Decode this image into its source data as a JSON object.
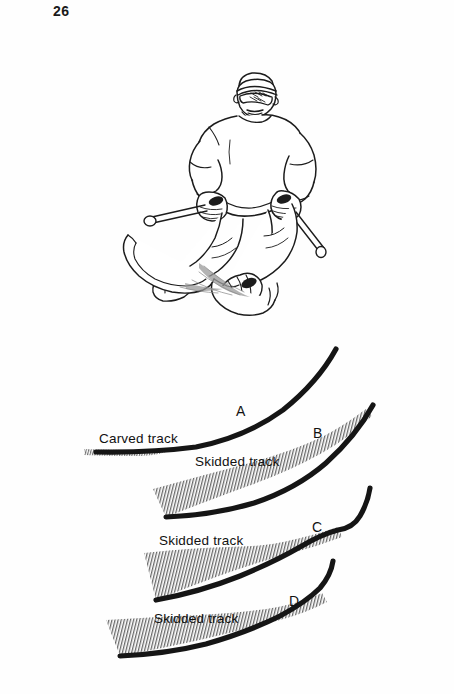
{
  "page": {
    "number": "26",
    "background_color": "#fefefe",
    "ink_color": "#111111"
  },
  "illustration": {
    "name": "skier-line-drawing",
    "description": "Line drawing of a skier in a carving turn, wearing a headband and goggles, holding ski poles, knees angled, skis edged"
  },
  "diagram": {
    "name": "ski-track-comparison",
    "tracks": [
      {
        "letter": "A",
        "label": "Carved track",
        "skid_width": "narrow"
      },
      {
        "letter": "B",
        "label": "Skidded track",
        "skid_width": "wide"
      },
      {
        "letter": "C",
        "label": "Skidded track",
        "skid_width": "wide"
      },
      {
        "letter": "D",
        "label": "Skidded track",
        "skid_width": "medium"
      }
    ]
  }
}
